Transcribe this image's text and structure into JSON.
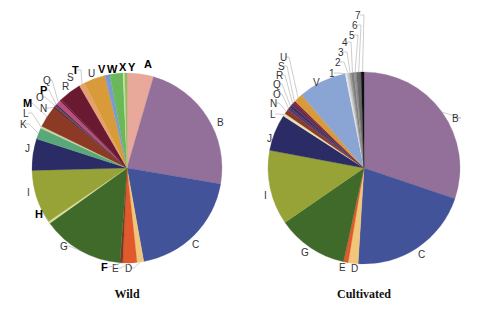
{
  "chart_data": [
    {
      "type": "pie",
      "title": "Wild",
      "center": [
        127,
        168
      ],
      "radius": 95,
      "start_angle_deg": 0,
      "direction": "clockwise",
      "slices": [
        {
          "label": "A",
          "value": 4.7,
          "color": "#e8a89a",
          "bold": true
        },
        {
          "label": "B",
          "value": 24.2,
          "color": "#93709a"
        },
        {
          "label": "C",
          "value": 20.3,
          "color": "#43539a"
        },
        {
          "label": "D",
          "value": 1.2,
          "color": "#f0c77a"
        },
        {
          "label": "E",
          "value": 2.5,
          "color": "#e05a2c"
        },
        {
          "label": "F",
          "value": 0.5,
          "color": "#7a3a20",
          "bold": true
        },
        {
          "label": "G",
          "value": 14.5,
          "color": "#3f6a2a"
        },
        {
          "label": "H",
          "value": 0.4,
          "color": "#d8df9a",
          "bold": true
        },
        {
          "label": "I",
          "value": 9.5,
          "color": "#97a336"
        },
        {
          "label": "J",
          "value": 5.6,
          "color": "#2b2c66"
        },
        {
          "label": "K",
          "value": 2.0,
          "color": "#5aa87a"
        },
        {
          "label": "L",
          "value": 0.4,
          "color": "#c8d49a"
        },
        {
          "label": "M",
          "value": 3.8,
          "color": "#8c3a26",
          "bold": true
        },
        {
          "label": "N",
          "value": 0.3,
          "color": "#5a2a20"
        },
        {
          "label": "O",
          "value": 0.3,
          "color": "#7a3a55"
        },
        {
          "label": "P",
          "value": 0.3,
          "color": "#3a3050",
          "bold": true
        },
        {
          "label": "Q",
          "value": 0.8,
          "color": "#c04a7a"
        },
        {
          "label": "R",
          "value": 0.3,
          "color": "#6a2040"
        },
        {
          "label": "S",
          "value": 4.0,
          "color": "#6a1a30"
        },
        {
          "label": "T",
          "value": 1.0,
          "color": "#e6a070",
          "bold": true
        },
        {
          "label": "U",
          "value": 3.8,
          "color": "#d99a3a"
        },
        {
          "label": "V",
          "value": 0.9,
          "color": "#7a9ad0",
          "bold": true
        },
        {
          "label": "W",
          "value": 2.3,
          "color": "#6ab85a",
          "bold": true
        },
        {
          "label": "X",
          "value": 0.3,
          "color": "#d0e0a0",
          "bold": true
        },
        {
          "label": "Y",
          "value": 0.4,
          "color": "#8ac060",
          "bold": true
        }
      ],
      "labels": [
        {
          "text": "A",
          "x": 144,
          "y": 68,
          "bold": true
        },
        {
          "text": "B",
          "x": 217,
          "y": 126
        },
        {
          "text": "C",
          "x": 192,
          "y": 248
        },
        {
          "text": "D",
          "x": 125,
          "y": 272
        },
        {
          "text": "E",
          "x": 112,
          "y": 272
        },
        {
          "text": "F",
          "x": 101,
          "y": 271,
          "bold": true
        },
        {
          "text": "G",
          "x": 60,
          "y": 250
        },
        {
          "text": "H",
          "x": 35,
          "y": 218,
          "bold": true
        },
        {
          "text": "I",
          "x": 27,
          "y": 196
        },
        {
          "text": "J",
          "x": 25,
          "y": 152
        },
        {
          "text": "K",
          "x": 20,
          "y": 128
        },
        {
          "text": "L",
          "x": 23,
          "y": 117
        },
        {
          "text": "M",
          "x": 23,
          "y": 107,
          "bold": true
        },
        {
          "text": "N",
          "x": 40,
          "y": 112
        },
        {
          "text": "O",
          "x": 36,
          "y": 101
        },
        {
          "text": "P",
          "x": 40,
          "y": 94,
          "bold": true
        },
        {
          "text": "Q",
          "x": 43,
          "y": 84
        },
        {
          "text": "R",
          "x": 62,
          "y": 90
        },
        {
          "text": "S",
          "x": 67,
          "y": 81
        },
        {
          "text": "T",
          "x": 72,
          "y": 74,
          "bold": true
        },
        {
          "text": "U",
          "x": 88,
          "y": 77
        },
        {
          "text": "V",
          "x": 98,
          "y": 73,
          "bold": true
        },
        {
          "text": "W",
          "x": 107,
          "y": 73,
          "bold": true
        },
        {
          "text": "X",
          "x": 119,
          "y": 71,
          "bold": true
        },
        {
          "text": "Y",
          "x": 128,
          "y": 71,
          "bold": true
        }
      ]
    },
    {
      "type": "pie",
      "title": "Cultivated",
      "center": [
        364,
        168
      ],
      "radius": 96,
      "start_angle_deg": 0,
      "direction": "clockwise",
      "slices": [
        {
          "label": "B",
          "value": 30.8,
          "color": "#93709a"
        },
        {
          "label": "C",
          "value": 21.2,
          "color": "#43539a"
        },
        {
          "label": "D",
          "value": 1.7,
          "color": "#f0c77a"
        },
        {
          "label": "E",
          "value": 0.8,
          "color": "#e05a2c"
        },
        {
          "label": "G",
          "value": 12.2,
          "color": "#3f6a2a"
        },
        {
          "label": "I",
          "value": 12.8,
          "color": "#97a336"
        },
        {
          "label": "J",
          "value": 6.3,
          "color": "#2b2c66"
        },
        {
          "label": "L",
          "value": 0.5,
          "color": "#e8e0b0"
        },
        {
          "label": "N",
          "value": 0.8,
          "color": "#8c3a26"
        },
        {
          "label": "O",
          "value": 0.5,
          "color": "#5a3a66"
        },
        {
          "label": "Q",
          "value": 0.5,
          "color": "#3a3060"
        },
        {
          "label": "R",
          "value": 0.6,
          "color": "#6a2a50"
        },
        {
          "label": "S",
          "value": 0.3,
          "color": "#7a2030"
        },
        {
          "label": "U",
          "value": 1.5,
          "color": "#d99a3a"
        },
        {
          "label": "V",
          "value": 8.3,
          "color": "#8aa4d4"
        },
        {
          "label": "1",
          "value": 0.3,
          "color": "#e8e8e8"
        },
        {
          "label": "2",
          "value": 0.4,
          "color": "#c8c8c8"
        },
        {
          "label": "3",
          "value": 0.3,
          "color": "#a0a0a0"
        },
        {
          "label": "4",
          "value": 0.5,
          "color": "#808080"
        },
        {
          "label": "5",
          "value": 0.4,
          "color": "#909090"
        },
        {
          "label": "6",
          "value": 0.8,
          "color": "#6a6a6a"
        },
        {
          "label": "7",
          "value": 0.5,
          "color": "#111111"
        }
      ],
      "labels": [
        {
          "text": "B",
          "x": 452,
          "y": 122
        },
        {
          "text": "C",
          "x": 418,
          "y": 258
        },
        {
          "text": "D",
          "x": 351,
          "y": 272
        },
        {
          "text": "E",
          "x": 339,
          "y": 271
        },
        {
          "text": "G",
          "x": 301,
          "y": 256
        },
        {
          "text": "I",
          "x": 264,
          "y": 199
        },
        {
          "text": "J",
          "x": 267,
          "y": 142
        },
        {
          "text": "L",
          "x": 270,
          "y": 118
        },
        {
          "text": "N",
          "x": 270,
          "y": 107
        },
        {
          "text": "O",
          "x": 273,
          "y": 98
        },
        {
          "text": "Q",
          "x": 273,
          "y": 88
        },
        {
          "text": "R",
          "x": 276,
          "y": 79
        },
        {
          "text": "S",
          "x": 278,
          "y": 70
        },
        {
          "text": "U",
          "x": 280,
          "y": 61
        },
        {
          "text": "V",
          "x": 313,
          "y": 86
        },
        {
          "text": "1",
          "x": 329,
          "y": 77
        },
        {
          "text": "2",
          "x": 335,
          "y": 66
        },
        {
          "text": "3",
          "x": 338,
          "y": 56
        },
        {
          "text": "4",
          "x": 342,
          "y": 46
        },
        {
          "text": "5",
          "x": 349,
          "y": 39
        },
        {
          "text": "6",
          "x": 352,
          "y": 29
        },
        {
          "text": "7",
          "x": 355,
          "y": 19
        }
      ]
    }
  ],
  "captions": {
    "wild": "Wild",
    "cultivated": "Cultivated"
  }
}
